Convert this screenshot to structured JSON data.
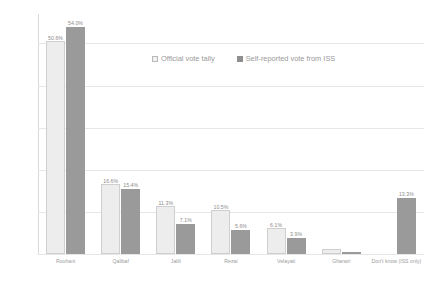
{
  "chart_data": {
    "type": "bar",
    "title": "",
    "xlabel": "",
    "ylabel": "",
    "ylim": [
      0,
      57
    ],
    "ytick_labels": [
      "50%",
      "40%",
      "30%",
      "20%",
      "10%",
      "0%"
    ],
    "ytick_values": [
      50,
      40,
      30,
      20,
      10,
      0
    ],
    "grid": true,
    "legend_position": "top-center",
    "categories": [
      "Rouhani",
      "Qalibaf",
      "Jalili",
      "Rezai",
      "Velayati",
      "Gharazi",
      "Don't know (ISS only)"
    ],
    "series": [
      {
        "name": "Official vote tally",
        "color": "#ededed",
        "values": [
          50.6,
          16.6,
          11.3,
          10.5,
          6.1,
          1.2,
          null
        ],
        "labels": [
          "50.6%",
          "16.6%",
          "11.3%",
          "10.5%",
          "6.1%",
          "",
          ""
        ]
      },
      {
        "name": "Self-reported vote from ISS",
        "color": "#9a9a9a",
        "values": [
          54.0,
          15.4,
          7.1,
          5.6,
          3.9,
          0.5,
          13.3
        ],
        "labels": [
          "54.0%",
          "15.4%",
          "7.1%",
          "5.6%",
          "3.9%",
          "",
          "13.3%"
        ]
      }
    ]
  },
  "legend": {
    "items": [
      {
        "label": "Official vote tally"
      },
      {
        "label": "Self-reported vote from ISS"
      }
    ]
  }
}
